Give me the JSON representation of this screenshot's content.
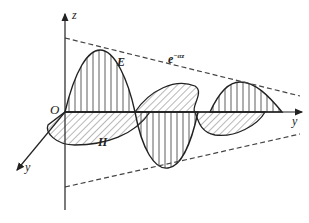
{
  "diagram": {
    "labels": {
      "z_axis": "z",
      "y_axis_right": "y",
      "y_axis_oblique": "y",
      "origin": "O",
      "e_field": "E",
      "h_field": "H",
      "envelope_base": "e",
      "envelope_exp": "−αz"
    },
    "colors": {
      "line": "#222222",
      "hatch": "#333333",
      "dashed": "#444444",
      "background": "#ffffff"
    },
    "envelope": {
      "upper": [
        [
          65,
          38
        ],
        [
          300,
          96
        ]
      ],
      "lower": [
        [
          65,
          187
        ],
        [
          300,
          134
        ]
      ]
    }
  }
}
